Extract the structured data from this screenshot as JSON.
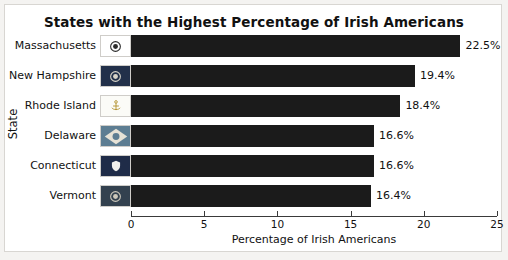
{
  "chart_data": {
    "type": "bar",
    "orientation": "horizontal",
    "title": "States with the Highest Percentage of Irish Americans",
    "xlabel": "Percentage of Irish Americans",
    "ylabel": "State",
    "xlim": [
      0,
      25
    ],
    "xticks": [
      0,
      5,
      10,
      15,
      20,
      25
    ],
    "xtick_labels": [
      "0",
      "5",
      "10",
      "15",
      "20",
      "25"
    ],
    "grid": false,
    "legend": null,
    "bar_color": "#1b1b1b",
    "categories": [
      "Massachusetts",
      "New Hampshire",
      "Rhode Island",
      "Delaware",
      "Connecticut",
      "Vermont"
    ],
    "values": [
      22.5,
      19.4,
      18.4,
      16.6,
      16.6,
      16.4
    ],
    "data_labels": [
      "22.5%",
      "19.4%",
      "18.4%",
      "16.6%",
      "16.6%",
      "16.4%"
    ],
    "rows": [
      {
        "state": "Massachusetts",
        "value": 22.5,
        "label": "22.5%",
        "icon": "massachusetts-flag-icon",
        "flag_bg": "#ffffff",
        "flag_fg": "#2c2c2c"
      },
      {
        "state": "New Hampshire",
        "value": 19.4,
        "label": "19.4%",
        "icon": "new-hampshire-flag-icon",
        "flag_bg": "#22304a",
        "flag_fg": "#d8d4c8"
      },
      {
        "state": "Rhode Island",
        "value": 18.4,
        "label": "18.4%",
        "icon": "rhode-island-flag-icon",
        "flag_bg": "#fbfbf7",
        "flag_fg": "#b3922f"
      },
      {
        "state": "Delaware",
        "value": 16.6,
        "label": "16.6%",
        "icon": "delaware-flag-icon",
        "flag_bg": "#5d7d92",
        "flag_fg": "#e6e2d6"
      },
      {
        "state": "Connecticut",
        "value": 16.6,
        "label": "16.6%",
        "icon": "connecticut-flag-icon",
        "flag_bg": "#1f2c48",
        "flag_fg": "#f2f1ec"
      },
      {
        "state": "Vermont",
        "value": 16.4,
        "label": "16.4%",
        "icon": "vermont-flag-icon",
        "flag_bg": "#33414f",
        "flag_fg": "#cdc8bb"
      }
    ]
  }
}
